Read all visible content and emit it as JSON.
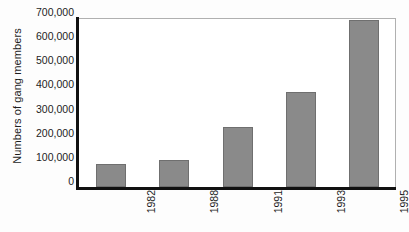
{
  "chart_data": {
    "type": "bar",
    "title": "",
    "xlabel": "",
    "ylabel": "Numbers of gang members",
    "categories": [
      "1982",
      "1988",
      "1991",
      "1993",
      "1995"
    ],
    "values": [
      95000,
      110000,
      250000,
      395000,
      690000
    ],
    "ylim": [
      0,
      700000
    ],
    "y_ticks": [
      0,
      100000,
      200000,
      300000,
      400000,
      500000,
      600000,
      700000
    ],
    "y_tick_labels": [
      "0",
      "100,000",
      "200,000",
      "300,000",
      "400,000",
      "500,000",
      "600,000",
      "700,000"
    ],
    "grid": false,
    "legend": false,
    "legend_position": "none",
    "series": [
      {
        "name": "Numbers of gang members",
        "values": [
          95000,
          110000,
          250000,
          395000,
          690000
        ]
      }
    ],
    "colors": {
      "bar_fill": "#8a8a8a",
      "bar_border": "#6f6f6f",
      "axis_line": "#111111",
      "frame_line": "#b0b0b0",
      "plot_background": "#ffffff",
      "text": "#1d1d1d"
    }
  }
}
